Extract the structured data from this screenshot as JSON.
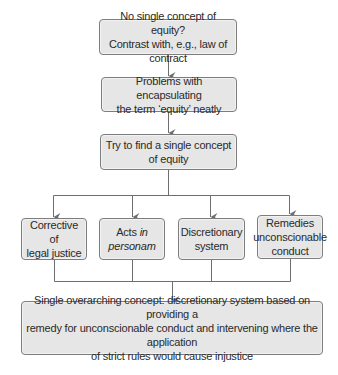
{
  "diagram": {
    "type": "flowchart",
    "colors": {
      "box_fill": "#e6e6e6",
      "box_border": "#7d7d7d",
      "line": "#6e6e6e",
      "text": "#2a2a2a"
    },
    "nodes": [
      {
        "id": "n1",
        "lines": [
          "No single concept of equity?",
          "Contrast with, e.g., law of contract"
        ]
      },
      {
        "id": "n2",
        "lines": [
          "Problems with encapsulating",
          "the term ‘equity’ neatly"
        ]
      },
      {
        "id": "n3",
        "lines": [
          "Try to find a single concept",
          "of equity"
        ]
      },
      {
        "id": "n4a",
        "lines": [
          "Corrective of",
          "legal justice"
        ]
      },
      {
        "id": "n4b",
        "line1_prefix": "Acts ",
        "line1_italic": "in",
        "line2_italic": "personam"
      },
      {
        "id": "n4c",
        "lines": [
          "Discretionary",
          "system"
        ]
      },
      {
        "id": "n4d",
        "lines": [
          "Remedies",
          "unconscionable",
          "conduct"
        ]
      },
      {
        "id": "n5",
        "lines": [
          "Single overarching concept: discretionary system based on providing a",
          "remedy for unconscionable conduct and intervening where the application",
          "of strict rules would cause injustice"
        ]
      }
    ],
    "edges": [
      {
        "from": "n1",
        "to": "n2"
      },
      {
        "from": "n2",
        "to": "n3"
      },
      {
        "from": "n3",
        "to": "n4a"
      },
      {
        "from": "n3",
        "to": "n4b"
      },
      {
        "from": "n3",
        "to": "n4c"
      },
      {
        "from": "n3",
        "to": "n4d"
      },
      {
        "from": "n4a",
        "to": "n5"
      },
      {
        "from": "n4b",
        "to": "n5"
      },
      {
        "from": "n4c",
        "to": "n5"
      },
      {
        "from": "n4d",
        "to": "n5"
      }
    ]
  }
}
